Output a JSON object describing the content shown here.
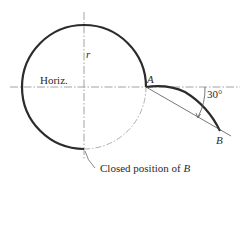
{
  "figure": {
    "labels": {
      "horiz": "Horiz.",
      "r": "r",
      "A": "A",
      "B": "B",
      "angle": "30°",
      "closed_prefix": "Closed position of ",
      "closed_var": "B"
    },
    "colors": {
      "ink": "#2b2b2b",
      "thin": "#555555",
      "centerline": "#8a8a8a"
    }
  }
}
